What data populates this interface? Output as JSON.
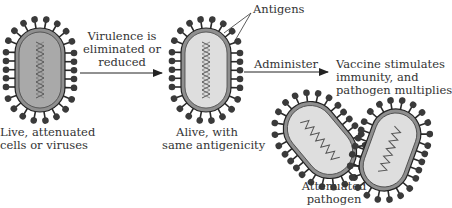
{
  "diagram": {
    "colors": {
      "ink": "#2a2a2a",
      "antigen": "#3a3a3a",
      "envelope": "#8f8f8f",
      "live_core": "#a9a9a9",
      "attenuated_core": "#dedede",
      "text": "#333333"
    },
    "nodes": [
      {
        "id": "live",
        "label_line1": "Live, attenuated",
        "label_line2": "cells or viruses"
      },
      {
        "id": "alive",
        "label_line1": "Alive, with",
        "label_line2": "same antigenicity"
      },
      {
        "id": "pathogen",
        "label_line1": "Attenuated",
        "label_line2": "pathogen"
      }
    ],
    "edges": [
      {
        "from": "live",
        "to": "alive",
        "label_line1": "Virulence is",
        "label_line2": "eliminated or",
        "label_line3": "reduced"
      },
      {
        "from": "alive",
        "to": "pathogen",
        "label_line1": "Administer"
      }
    ],
    "callout": {
      "label": "Antigens"
    },
    "outcome": {
      "line1": "Vaccine stimulates",
      "line2": "immunity, and",
      "line3": "pathogen multiplies"
    }
  }
}
